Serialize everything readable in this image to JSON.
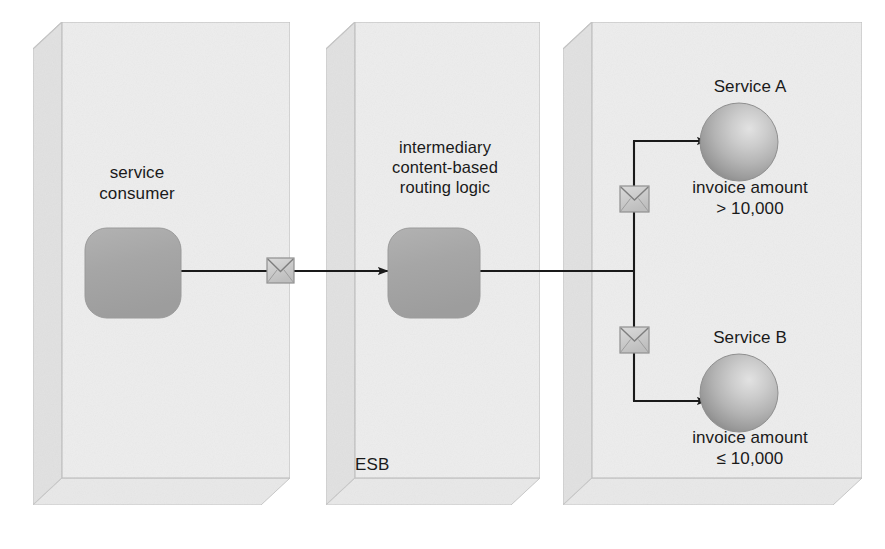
{
  "diagram": {
    "background_color": "#ffffff",
    "box_fill_color": "#ececec",
    "box_top_color": "#e4e4e4",
    "box_side_color": "#e0e0e0",
    "box_edge_color": "#c3c3c3",
    "shape_fill_color": "#a8a8a8",
    "line_color": "#1a1a1a",
    "text_color": "#1a1a1a",
    "envelope_fill_color": "#cccccc",
    "sphere_color": "#b0b0b0"
  },
  "containers": [
    {
      "id": "consumer-container",
      "label": ""
    },
    {
      "id": "esb-container",
      "label": "ESB"
    },
    {
      "id": "services-container",
      "label": ""
    }
  ],
  "labels": {
    "service_consumer": "service\nconsumer",
    "intermediary": "intermediary\ncontent-based\nrouting logic",
    "esb": "ESB",
    "service_a_title": "Service A",
    "service_a_condition": "invoice amount\n> 10,000",
    "service_b_title": "Service B",
    "service_b_condition": "invoice amount\n≤ 10,000"
  },
  "nodes": [
    {
      "id": "service-consumer",
      "type": "rounded-rectangle",
      "label": "service consumer"
    },
    {
      "id": "routing-logic",
      "type": "rounded-rectangle",
      "label": "intermediary content-based routing logic"
    },
    {
      "id": "service-a",
      "type": "sphere",
      "label": "Service A",
      "condition": "invoice amount > 10,000"
    },
    {
      "id": "service-b",
      "type": "sphere",
      "label": "Service B",
      "condition": "invoice amount ≤ 10,000"
    }
  ],
  "messages": [
    {
      "id": "message-request",
      "icon": "envelope-icon"
    },
    {
      "id": "message-route-a",
      "icon": "envelope-icon"
    },
    {
      "id": "message-route-b",
      "icon": "envelope-icon"
    }
  ],
  "connections": [
    {
      "id": "consumer-to-esb",
      "from": "service-consumer",
      "to": "routing-logic"
    },
    {
      "id": "esb-to-service-a",
      "from": "routing-logic",
      "to": "service-a"
    },
    {
      "id": "esb-to-service-b",
      "from": "routing-logic",
      "to": "service-b"
    }
  ]
}
